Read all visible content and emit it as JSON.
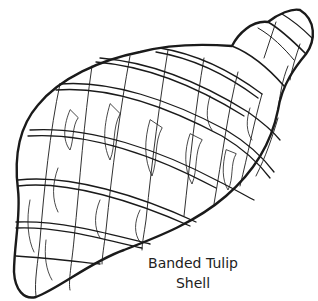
{
  "illustration": {
    "subject": "shell-line-drawing",
    "stroke_color": "#1a1a1a",
    "background_color": "#ffffff"
  },
  "caption": {
    "line1": "Banded Tulip",
    "line2": "Shell"
  }
}
